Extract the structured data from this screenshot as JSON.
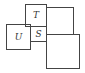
{
  "diagram": {
    "squares": [
      {
        "id": "T",
        "label": "T"
      },
      {
        "id": "U",
        "label": "U"
      },
      {
        "id": "S",
        "label": "S"
      },
      {
        "id": "top-right",
        "label": ""
      },
      {
        "id": "bottom-right",
        "label": ""
      }
    ]
  },
  "colors": {
    "stroke": "#444444",
    "background": "#ffffff"
  }
}
